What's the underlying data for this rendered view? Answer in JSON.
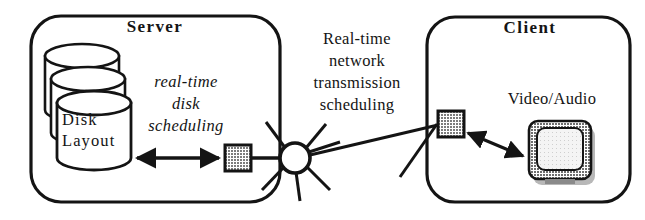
{
  "diagram": {
    "colors": {
      "stroke": "#141414",
      "background": "#ffffff",
      "gray_fill": "#9a9a9a",
      "screen_fill": "#f2f2f2",
      "bezel_fill": "#8c8c8c"
    },
    "server": {
      "title": "Server",
      "disk_label_line1": "Disk",
      "disk_label_line2": "Layout",
      "scheduling_line1": "real-time",
      "scheduling_line2": "disk",
      "scheduling_line3": "scheduling",
      "disk_count": 3
    },
    "network": {
      "label_line1": "Real-time",
      "label_line2": "network",
      "label_line3": "transmission",
      "label_line4": "scheduling",
      "hub_spokes": 7
    },
    "client": {
      "title": "Client",
      "media_label": "Video/Audio"
    }
  }
}
